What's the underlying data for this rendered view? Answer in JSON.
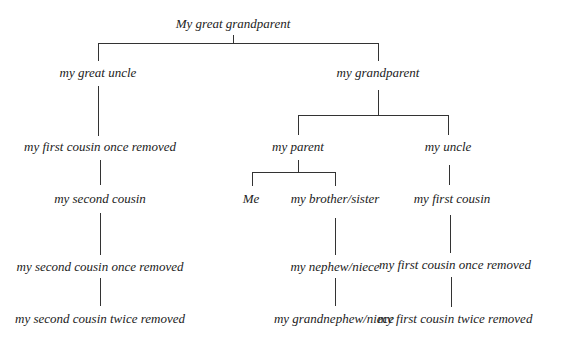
{
  "diagram": {
    "type": "family-tree",
    "nodes": {
      "great_grandparent": "My great grandparent",
      "great_uncle": "my great uncle",
      "grandparent": "my grandparent",
      "first_cousin_once_removed_left": "my first cousin once removed",
      "parent": "my parent",
      "uncle": "my uncle",
      "second_cousin": "my second cousin",
      "me": "Me",
      "brother_sister": "my brother/sister",
      "first_cousin": "my first cousin",
      "second_cousin_once_removed": "my second cousin once removed",
      "nephew_niece": "my nephew/niece",
      "first_cousin_once_removed_right": "my first cousin once removed",
      "second_cousin_twice_removed": "my second cousin twice removed",
      "grandnephew_niece": "my grandnephew/niece",
      "first_cousin_twice_removed": "my first cousin twice removed"
    },
    "edges": [
      [
        "great_grandparent",
        "great_uncle"
      ],
      [
        "great_grandparent",
        "grandparent"
      ],
      [
        "great_uncle",
        "first_cousin_once_removed_left"
      ],
      [
        "first_cousin_once_removed_left",
        "second_cousin"
      ],
      [
        "second_cousin",
        "second_cousin_once_removed"
      ],
      [
        "second_cousin_once_removed",
        "second_cousin_twice_removed"
      ],
      [
        "grandparent",
        "parent"
      ],
      [
        "grandparent",
        "uncle"
      ],
      [
        "parent",
        "me"
      ],
      [
        "parent",
        "brother_sister"
      ],
      [
        "brother_sister",
        "nephew_niece"
      ],
      [
        "nephew_niece",
        "grandnephew_niece"
      ],
      [
        "uncle",
        "first_cousin"
      ],
      [
        "first_cousin",
        "first_cousin_once_removed_right"
      ],
      [
        "first_cousin_once_removed_right",
        "first_cousin_twice_removed"
      ]
    ]
  }
}
